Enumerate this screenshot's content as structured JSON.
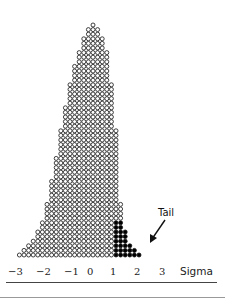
{
  "chart_data": {
    "type": "dot-histogram",
    "title": "",
    "xlabel": "Sigma",
    "ylabel": "",
    "x_ticks": [
      "−3",
      "−2",
      "−1",
      "0",
      "1",
      "2",
      "3"
    ],
    "x_tick_values": [
      -3,
      -2,
      -1,
      0,
      1,
      2,
      3
    ],
    "column_heights": [
      1,
      2,
      3,
      4,
      6,
      8,
      12,
      17,
      22,
      28,
      33,
      38,
      42,
      45,
      48,
      50,
      51,
      50,
      48,
      45,
      38,
      28,
      12,
      6,
      3,
      2,
      1
    ],
    "tail_start_column": 21,
    "annotation": "Tail",
    "tail_color": "#000000",
    "body_color": "#ffffff",
    "outline_color": "#111111"
  },
  "labels": {
    "tail": "Tail",
    "axis": "Sigma"
  }
}
